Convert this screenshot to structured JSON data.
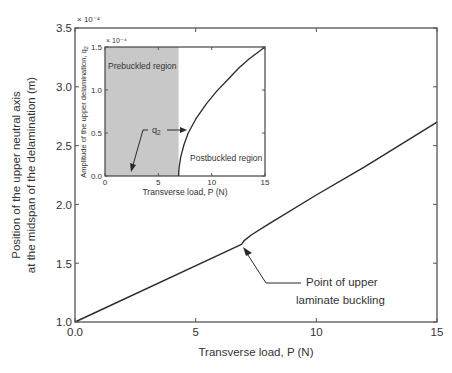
{
  "chart_data": [
    {
      "id": "main",
      "type": "line",
      "title": "",
      "xlabel": "Transverse load, P (N)",
      "ylabel_line1": "Position of the upper neutral axis",
      "ylabel_line2": "at the midspan of the delamination (m)",
      "y_multiplier": "× 10⁻⁴",
      "xlim": [
        0,
        15
      ],
      "ylim": [
        1.0,
        3.5
      ],
      "xticks": [
        0,
        5,
        10,
        15
      ],
      "xtick_labels": [
        "0.0",
        "5",
        "10",
        "15"
      ],
      "yticks": [
        1.0,
        1.5,
        2.0,
        2.5,
        3.0,
        3.5
      ],
      "ytick_labels": [
        "1.0",
        "1.5",
        "2.0",
        "2.5",
        "3.0",
        "3.5"
      ],
      "grid": false,
      "series": [
        {
          "name": "Upper neutral axis position",
          "x": [
            0,
            6.9,
            7.0,
            7.3,
            8,
            10,
            12,
            15
          ],
          "y": [
            1.0,
            1.66,
            1.69,
            1.74,
            1.83,
            2.08,
            2.32,
            2.7
          ]
        }
      ],
      "annotations": [
        {
          "text_line1": "Point of upper",
          "text_line2": "laminate buckling",
          "point": [
            6.95,
            1.655
          ]
        }
      ]
    },
    {
      "id": "inset",
      "type": "line",
      "title": "",
      "xlabel": "Transverse load, P (N)",
      "ylabel": "Amplitude of the upper delamination, q",
      "ylabel_sub": "2",
      "y_multiplier": "× 10⁻⁴",
      "xlim": [
        0,
        15
      ],
      "ylim": [
        0.0,
        1.5
      ],
      "xticks": [
        0,
        5,
        10,
        15
      ],
      "xtick_labels": [
        "0",
        "5",
        "10",
        "15"
      ],
      "yticks": [
        0.0,
        0.5,
        1.0,
        1.5
      ],
      "ytick_labels": [
        "0.0",
        "0.5",
        "1.0",
        "1.5"
      ],
      "grid": false,
      "shaded_region": {
        "x": [
          0,
          6.9
        ],
        "label": "Prebuckled region",
        "color": "#c8c8c8"
      },
      "region_label_post": "Postbuckled region",
      "series": [
        {
          "name": "q2",
          "x": [
            6.9,
            6.95,
            7.1,
            7.4,
            7.8,
            8.5,
            9.5,
            10.5,
            11.5,
            12.5,
            13.5,
            15
          ],
          "y": [
            0.0,
            0.1,
            0.22,
            0.36,
            0.5,
            0.66,
            0.84,
            0.99,
            1.12,
            1.25,
            1.36,
            1.5
          ]
        }
      ],
      "annotations": [
        {
          "text": "q",
          "sub": "2"
        }
      ]
    }
  ],
  "colors": {
    "line": "#2a2a2a",
    "axis": "#555555",
    "shade": "#c8c8c8",
    "text": "#333333"
  }
}
